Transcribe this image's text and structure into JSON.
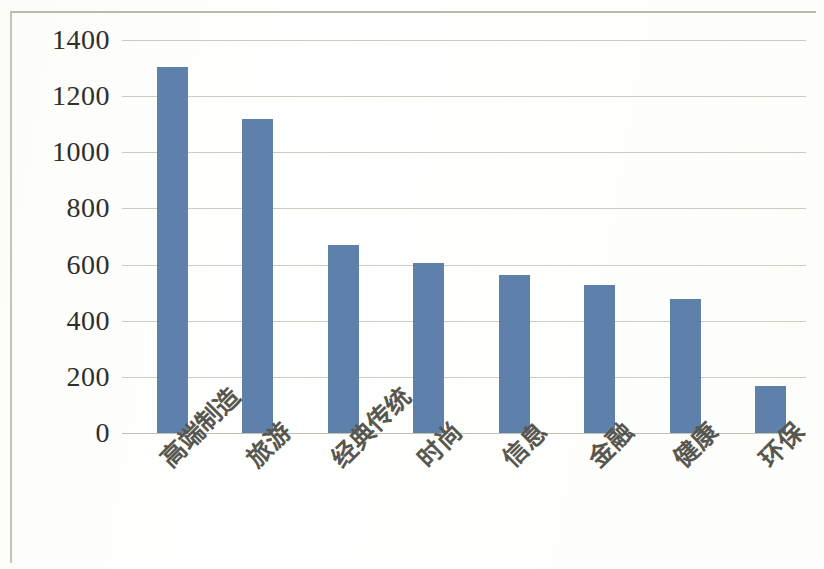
{
  "chart_data": {
    "type": "bar",
    "title": "",
    "subtitle": "",
    "xlabel": "",
    "ylabel": "",
    "legend": [],
    "legend_position": "none",
    "grid": true,
    "grid_axis": "y",
    "ylim": [
      0,
      1400
    ],
    "yticks": [
      0,
      200,
      400,
      600,
      800,
      1000,
      1200,
      1400
    ],
    "ytick_labels": [
      "0",
      "200",
      "400",
      "600",
      "800",
      "1000",
      "1200",
      "1400"
    ],
    "categories": [
      "高端制造",
      "旅游",
      "经典传统",
      "时尚",
      "信息",
      "金融",
      "健康",
      "环保"
    ],
    "values": [
      1305,
      1120,
      670,
      605,
      563,
      528,
      476,
      168
    ],
    "bar_color": "#5e81ac",
    "grid_color": "#ccccc0",
    "text_color": "#2f2f2c",
    "background": "#fefefe"
  },
  "axis": {
    "y_ticks": [
      {
        "label": "1400",
        "value": 1400
      },
      {
        "label": "1200",
        "value": 1200
      },
      {
        "label": "1000",
        "value": 1000
      },
      {
        "label": "800",
        "value": 800
      },
      {
        "label": "600",
        "value": 600
      },
      {
        "label": "400",
        "value": 400
      },
      {
        "label": "200",
        "value": 200
      },
      {
        "label": "0",
        "value": 0
      }
    ],
    "x_categories": [
      {
        "label": "高端制造"
      },
      {
        "label": "旅游"
      },
      {
        "label": "经典传统"
      },
      {
        "label": "时尚"
      },
      {
        "label": "信息"
      },
      {
        "label": "金融"
      },
      {
        "label": "健康"
      },
      {
        "label": "环保"
      }
    ]
  },
  "series": [
    {
      "name": "",
      "points": [
        {
          "category": "高端制造",
          "value": 1305
        },
        {
          "category": "旅游",
          "value": 1120
        },
        {
          "category": "经典传统",
          "value": 670
        },
        {
          "category": "时尚",
          "value": 605
        },
        {
          "category": "信息",
          "value": 563
        },
        {
          "category": "金融",
          "value": 528
        },
        {
          "category": "健康",
          "value": 476
        },
        {
          "category": "环保",
          "value": 168
        }
      ]
    }
  ]
}
